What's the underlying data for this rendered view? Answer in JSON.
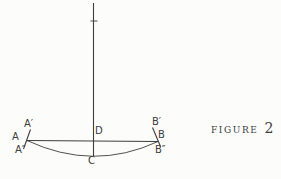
{
  "figure": {
    "caption": {
      "word": "FIGURE",
      "number": "2"
    },
    "labels": {
      "a_prime": "A′",
      "a": "A",
      "a_dbl": "A″",
      "d": "D",
      "c": "C",
      "b_prime": "B′",
      "b": "B",
      "b_dbl": "B″"
    },
    "colors": {
      "ink": "#3d3d3d",
      "background": "#fcfcfa"
    }
  }
}
